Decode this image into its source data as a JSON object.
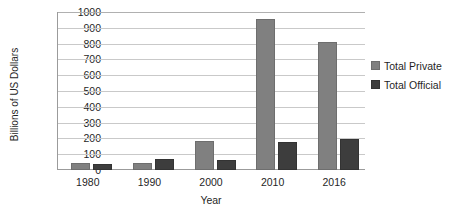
{
  "chart_data": {
    "type": "bar",
    "title": "",
    "xlabel": "Year",
    "ylabel": "Billions of US Dollars",
    "categories": [
      "1980",
      "1990",
      "2000",
      "2010",
      "2016"
    ],
    "series": [
      {
        "name": "Total Private",
        "color": "#808080",
        "values": [
          45,
          42,
          185,
          955,
          810
        ]
      },
      {
        "name": "Total Official",
        "color": "#3d3d3d",
        "values": [
          38,
          72,
          65,
          175,
          195
        ]
      }
    ],
    "ylim": [
      0,
      1000
    ],
    "yticks": [
      "1000",
      "900",
      "800",
      "700",
      "600",
      "500",
      "400",
      "300",
      "200",
      "100",
      "0"
    ],
    "ytick_values": [
      1000,
      900,
      800,
      700,
      600,
      500,
      400,
      300,
      200,
      100,
      0
    ],
    "grid": true,
    "legend_position": "right"
  },
  "legend": {
    "items": [
      {
        "label": "Total Private",
        "color": "#808080"
      },
      {
        "label": "Total Official",
        "color": "#3d3d3d"
      }
    ]
  }
}
